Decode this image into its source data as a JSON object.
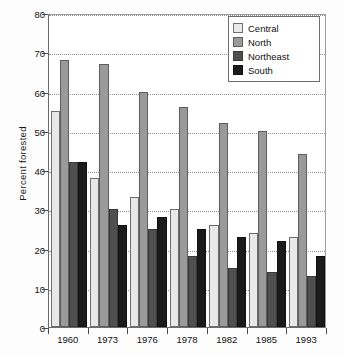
{
  "chart_data": {
    "type": "bar",
    "title": "",
    "xlabel": "",
    "ylabel": "Percent forested",
    "categories": [
      "1960",
      "1973",
      "1976",
      "1978",
      "1982",
      "1985",
      "1993"
    ],
    "series": [
      {
        "name": "Central",
        "color": "#e8e8e8",
        "values": [
          55,
          38,
          33,
          30,
          26,
          24,
          23
        ]
      },
      {
        "name": "North",
        "color": "#9a9a9a",
        "values": [
          68,
          67,
          60,
          56,
          52,
          50,
          44
        ]
      },
      {
        "name": "Northeast",
        "color": "#4f4f4f",
        "values": [
          42,
          30,
          25,
          18,
          15,
          14,
          13
        ]
      },
      {
        "name": "South",
        "color": "#1b1b1b",
        "values": [
          42,
          26,
          28,
          25,
          23,
          22,
          18
        ]
      }
    ],
    "ylim": [
      0,
      80
    ],
    "yticks": [
      0,
      10,
      20,
      30,
      40,
      50,
      60,
      70,
      80
    ],
    "ytick_labels": [
      "0",
      "10",
      "20",
      "30",
      "40",
      "50",
      "60",
      "70",
      "80"
    ],
    "grid": true,
    "grid_axis": "y",
    "legend_position": "top-right",
    "legend_entries": [
      "Central",
      "North",
      "Northeast",
      "South"
    ]
  },
  "axes": {
    "y_title": "Percent forested",
    "y_tick_labels": [
      "80",
      "70",
      "60",
      "50",
      "40",
      "30",
      "20",
      "10",
      "0"
    ],
    "x_tick_labels": [
      "1960",
      "1973",
      "1976",
      "1978",
      "1982",
      "1985",
      "1993"
    ]
  },
  "legend": {
    "items": [
      {
        "label": "Central"
      },
      {
        "label": "North"
      },
      {
        "label": "Northeast"
      },
      {
        "label": "South"
      }
    ]
  },
  "caption": {
    "text": ""
  }
}
